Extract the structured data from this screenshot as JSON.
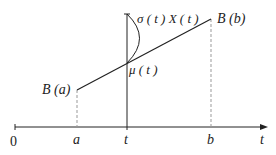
{
  "diagram": {
    "type": "brownian-bridge-interpolation",
    "axis": {
      "origin_label": "0",
      "axis_label": "t",
      "ticks": [
        {
          "name": "a",
          "label": "a"
        },
        {
          "name": "t",
          "label": "t"
        },
        {
          "name": "b",
          "label": "b"
        }
      ]
    },
    "points": {
      "start": "B (a)",
      "end": "B (b)"
    },
    "mean_label": "μ ( t )",
    "spread_label": "σ ( t ) X ( t )",
    "colors": {
      "stroke": "#222222",
      "dashed": "#999999"
    }
  }
}
